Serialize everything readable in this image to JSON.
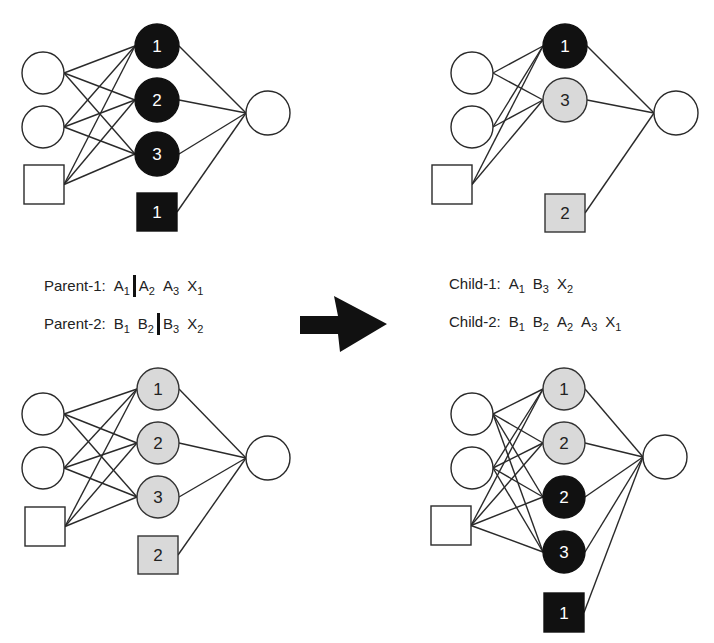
{
  "colors": {
    "black": "#111111",
    "gray": "#d9d9d9",
    "white": "#ffffff",
    "line": "#2a2a2a"
  },
  "networks": [
    {
      "id": "parent-1-network",
      "inputs": [
        {
          "shape": "circle",
          "cx": 43,
          "cy": 73,
          "r": 21
        },
        {
          "shape": "circle",
          "cx": 43,
          "cy": 127,
          "r": 21
        },
        {
          "shape": "square",
          "x": 24,
          "y": 165,
          "w": 40,
          "h": 39
        }
      ],
      "hidden": [
        {
          "shape": "circle",
          "cx": 157,
          "cy": 46,
          "r": 22,
          "fill": "black",
          "label": "1"
        },
        {
          "shape": "circle",
          "cx": 157,
          "cy": 100,
          "r": 22,
          "fill": "black",
          "label": "2"
        },
        {
          "shape": "circle",
          "cx": 157,
          "cy": 154,
          "r": 22,
          "fill": "black",
          "label": "3"
        },
        {
          "shape": "square",
          "x": 137,
          "y": 193,
          "w": 40,
          "h": 38,
          "fill": "black",
          "label": "1",
          "bias": true
        }
      ],
      "output": {
        "cx": 268,
        "cy": 113,
        "r": 22
      }
    },
    {
      "id": "child-1-network",
      "inputs": [
        {
          "shape": "circle",
          "cx": 472,
          "cy": 73,
          "r": 21
        },
        {
          "shape": "circle",
          "cx": 472,
          "cy": 127,
          "r": 21
        },
        {
          "shape": "square",
          "x": 432,
          "y": 165,
          "w": 40,
          "h": 39
        }
      ],
      "hidden": [
        {
          "shape": "circle",
          "cx": 565,
          "cy": 46,
          "r": 22,
          "fill": "black",
          "label": "1"
        },
        {
          "shape": "circle",
          "cx": 565,
          "cy": 100,
          "r": 22,
          "fill": "gray",
          "label": "3"
        },
        {
          "shape": "square",
          "x": 545,
          "y": 194,
          "w": 40,
          "h": 38,
          "fill": "gray",
          "label": "2",
          "bias": true
        }
      ],
      "output": {
        "cx": 676,
        "cy": 113,
        "r": 22
      }
    },
    {
      "id": "parent-2-network",
      "inputs": [
        {
          "shape": "circle",
          "cx": 43,
          "cy": 414,
          "r": 21
        },
        {
          "shape": "circle",
          "cx": 43,
          "cy": 468,
          "r": 21
        },
        {
          "shape": "square",
          "x": 25,
          "y": 507,
          "w": 40,
          "h": 39
        }
      ],
      "hidden": [
        {
          "shape": "circle",
          "cx": 158,
          "cy": 389,
          "r": 21,
          "fill": "gray",
          "label": "1"
        },
        {
          "shape": "circle",
          "cx": 158,
          "cy": 443,
          "r": 21,
          "fill": "gray",
          "label": "2"
        },
        {
          "shape": "circle",
          "cx": 158,
          "cy": 497,
          "r": 21,
          "fill": "gray",
          "label": "3"
        },
        {
          "shape": "square",
          "x": 138,
          "y": 536,
          "w": 40,
          "h": 38,
          "fill": "gray",
          "label": "2",
          "bias": true
        }
      ],
      "output": {
        "cx": 268,
        "cy": 458,
        "r": 22
      }
    },
    {
      "id": "child-2-network",
      "inputs": [
        {
          "shape": "circle",
          "cx": 472,
          "cy": 414,
          "r": 21
        },
        {
          "shape": "circle",
          "cx": 472,
          "cy": 468,
          "r": 21
        },
        {
          "shape": "square",
          "x": 431,
          "y": 506,
          "w": 40,
          "h": 39
        }
      ],
      "hidden": [
        {
          "shape": "circle",
          "cx": 564,
          "cy": 389,
          "r": 21,
          "fill": "gray",
          "label": "1"
        },
        {
          "shape": "circle",
          "cx": 564,
          "cy": 443,
          "r": 21,
          "fill": "gray",
          "label": "2"
        },
        {
          "shape": "circle",
          "cx": 564,
          "cy": 497,
          "r": 21,
          "fill": "black",
          "label": "2"
        },
        {
          "shape": "circle",
          "cx": 564,
          "cy": 552,
          "r": 21,
          "fill": "black",
          "label": "3"
        },
        {
          "shape": "square",
          "x": 544,
          "y": 593,
          "w": 40,
          "h": 39,
          "fill": "black",
          "label": "1",
          "bias": true
        }
      ],
      "output": {
        "cx": 665,
        "cy": 457,
        "r": 22
      }
    }
  ],
  "chromosomes": {
    "parent1": {
      "label": "Parent-1:",
      "genes": [
        {
          "l": "A",
          "s": "1"
        },
        {
          "cut": true
        },
        {
          "l": "A",
          "s": "2"
        },
        {
          "l": "A",
          "s": "3"
        },
        {
          "l": "X",
          "s": "1"
        }
      ]
    },
    "parent2": {
      "label": "Parent-2:",
      "genes": [
        {
          "l": "B",
          "s": "1"
        },
        {
          "l": "B",
          "s": "2"
        },
        {
          "cut": true
        },
        {
          "l": "B",
          "s": "3"
        },
        {
          "l": "X",
          "s": "2"
        }
      ]
    },
    "child1": {
      "label": "Child-1:",
      "genes": [
        {
          "l": "A",
          "s": "1"
        },
        {
          "l": "B",
          "s": "3"
        },
        {
          "l": "X",
          "s": "2"
        }
      ]
    },
    "child2": {
      "label": "Child-2:",
      "genes": [
        {
          "l": "B",
          "s": "1"
        },
        {
          "l": "B",
          "s": "2"
        },
        {
          "l": "A",
          "s": "2"
        },
        {
          "l": "A",
          "s": "3"
        },
        {
          "l": "X",
          "s": "1"
        }
      ]
    }
  },
  "arrow": {
    "points": "300,316 338,316 334,296 387,324 340,352 338,334 300,334",
    "icon": "crossover-arrow-icon"
  }
}
